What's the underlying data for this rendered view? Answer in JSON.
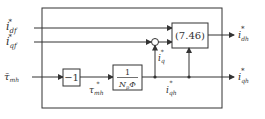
{
  "diagram": {
    "type": "block-diagram",
    "inputs": {
      "i_df": {
        "base": "i",
        "sub": "df",
        "sup": "*"
      },
      "i_qf": {
        "base": "i",
        "sub": "qf",
        "sup": "*"
      },
      "tau_mh": {
        "base": "τ̄",
        "sub": "mh"
      }
    },
    "blocks": {
      "neg_gain": {
        "label": "−1"
      },
      "torque_gain": {
        "numerator": "1",
        "denominator": "N",
        "den_sub": "p",
        "den_tail": "Φ"
      },
      "eq_block": {
        "label": "(7.46)"
      }
    },
    "signals": {
      "tau_mh_star": {
        "base": "τ",
        "sub": "mh",
        "sup": "*"
      },
      "i_q_star": {
        "base": "i",
        "sub": "q",
        "sup": "*"
      },
      "i_qh_star_mid": {
        "base": "i",
        "sub": "qh",
        "sup": "*"
      }
    },
    "outputs": {
      "i_dh": {
        "base": "i",
        "sub": "dh",
        "sup": "*"
      },
      "i_qh": {
        "base": "i",
        "sub": "qh",
        "sup": "*"
      }
    },
    "colors": {
      "line": "#333333",
      "background": "#ffffff"
    }
  }
}
